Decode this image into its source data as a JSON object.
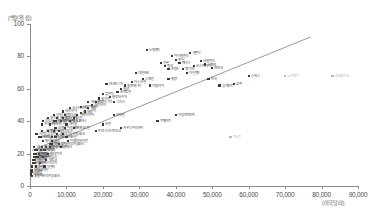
{
  "chart_data": {
    "type": "scatter",
    "title": "",
    "xlabel": "(미국달러)",
    "ylabel": "(백분위 점)",
    "xlim": [
      0,
      90000
    ],
    "ylim": [
      0,
      100
    ],
    "xticks": [
      "0",
      "10,000",
      "20,000",
      "30,000",
      "40,000",
      "50,000",
      "60,000",
      "70,000",
      "80,000",
      "90,000"
    ],
    "xtick_values": [
      0,
      10000,
      20000,
      30000,
      40000,
      50000,
      60000,
      70000,
      80000,
      90000
    ],
    "yticks": [
      "0",
      "20",
      "40",
      "60",
      "80",
      "100"
    ],
    "ytick_values": [
      0,
      20,
      40,
      60,
      80,
      100
    ],
    "grid": false,
    "legend": "none",
    "trendline": {
      "x0": 500,
      "y0": 22,
      "x1": 77000,
      "y1": 92,
      "color": "#6d6d6d"
    },
    "points": [
      {
        "label": "룩셈부르크",
        "x": 83000,
        "y": 68,
        "grey": true
      },
      {
        "label": "노르웨이",
        "x": 70000,
        "y": 68,
        "grey": true
      },
      {
        "label": "스위스",
        "x": 60000,
        "y": 68
      },
      {
        "label": "카타르",
        "x": 55000,
        "y": 30,
        "grey": true
      },
      {
        "label": "호주",
        "x": 56000,
        "y": 63
      },
      {
        "label": "덴마크",
        "x": 50000,
        "y": 73
      },
      {
        "label": "스웨덴",
        "x": 48000,
        "y": 75
      },
      {
        "label": "네덜란드",
        "x": 47000,
        "y": 77
      },
      {
        "label": "미국",
        "x": 49000,
        "y": 66
      },
      {
        "label": "오스트리아",
        "x": 45000,
        "y": 74
      },
      {
        "label": "핀란드",
        "x": 44000,
        "y": 82
      },
      {
        "label": "아일랜드",
        "x": 43000,
        "y": 70
      },
      {
        "label": "벨기에",
        "x": 42000,
        "y": 72
      },
      {
        "label": "캐나다",
        "x": 41000,
        "y": 76
      },
      {
        "label": "독일",
        "x": 40000,
        "y": 78
      },
      {
        "label": "아이슬란드",
        "x": 39000,
        "y": 80
      },
      {
        "label": "프랑스",
        "x": 38000,
        "y": 72
      },
      {
        "label": "영국",
        "x": 37000,
        "y": 74
      },
      {
        "label": "일본",
        "x": 36000,
        "y": 76
      },
      {
        "label": "뉴질랜드",
        "x": 32000,
        "y": 84
      },
      {
        "label": "이탈리아",
        "x": 33000,
        "y": 62
      },
      {
        "label": "스페인",
        "x": 31000,
        "y": 66
      },
      {
        "label": "대한민국",
        "x": 29000,
        "y": 70
      },
      {
        "label": "이스라엘",
        "x": 28000,
        "y": 64
      },
      {
        "label": "슬로베니아",
        "x": 26000,
        "y": 62
      },
      {
        "label": "체코",
        "x": 25000,
        "y": 60
      },
      {
        "label": "포르투갈",
        "x": 24000,
        "y": 58
      },
      {
        "label": "그리스",
        "x": 23000,
        "y": 52
      },
      {
        "label": "슬로바키아",
        "x": 22000,
        "y": 55
      },
      {
        "label": "에스토니아",
        "x": 21000,
        "y": 63
      },
      {
        "label": "폴란드",
        "x": 20000,
        "y": 57
      },
      {
        "label": "헝가리",
        "x": 19000,
        "y": 54
      },
      {
        "label": "리투아니아",
        "x": 18000,
        "y": 52
      },
      {
        "label": "라트비아",
        "x": 17000,
        "y": 50
      },
      {
        "label": "칠레",
        "x": 16000,
        "y": 48
      },
      {
        "label": "러시아",
        "x": 15000,
        "y": 46
      },
      {
        "label": "크로아티아",
        "x": 14000,
        "y": 49
      },
      {
        "label": "말레이시아",
        "x": 13000,
        "y": 44
      },
      {
        "label": "터키",
        "x": 12000,
        "y": 42
      },
      {
        "label": "멕시코",
        "x": 11000,
        "y": 40
      },
      {
        "label": "브라질",
        "x": 10000,
        "y": 38
      },
      {
        "label": "아르헨티나",
        "x": 9500,
        "y": 36
      },
      {
        "label": "불가리아",
        "x": 9000,
        "y": 42
      },
      {
        "label": "루마니아",
        "x": 8500,
        "y": 40
      },
      {
        "label": "남아프리카공화국",
        "x": 8000,
        "y": 26
      },
      {
        "label": "중국",
        "x": 7500,
        "y": 32
      },
      {
        "label": "콜롬비아",
        "x": 7000,
        "y": 30
      },
      {
        "label": "태국",
        "x": 6500,
        "y": 34
      },
      {
        "label": "페루",
        "x": 6000,
        "y": 28
      },
      {
        "label": "이란",
        "x": 5500,
        "y": 26
      },
      {
        "label": "인도네시아",
        "x": 4500,
        "y": 24
      },
      {
        "label": "이집트",
        "x": 4000,
        "y": 22
      },
      {
        "label": "필리핀",
        "x": 3500,
        "y": 28
      },
      {
        "label": "베트남",
        "x": 3000,
        "y": 30
      },
      {
        "label": "우크라이나",
        "x": 3200,
        "y": 38
      },
      {
        "label": "스리랑카",
        "x": 3400,
        "y": 34
      },
      {
        "label": "인도",
        "x": 2500,
        "y": 20
      },
      {
        "label": "파키스탄",
        "x": 2000,
        "y": 18
      },
      {
        "label": "방글라데시",
        "x": 1500,
        "y": 20
      },
      {
        "label": "케냐",
        "x": 1300,
        "y": 22
      },
      {
        "label": "가나",
        "x": 1200,
        "y": 24
      },
      {
        "label": "네팔",
        "x": 1000,
        "y": 18
      },
      {
        "label": "탄자니아",
        "x": 900,
        "y": 16
      },
      {
        "label": "우간다",
        "x": 800,
        "y": 14
      },
      {
        "label": "모잠비크",
        "x": 600,
        "y": 12
      },
      {
        "label": "에티오피아",
        "x": 500,
        "y": 10
      },
      {
        "label": "말라위",
        "x": 400,
        "y": 9
      },
      {
        "label": "부룬디",
        "x": 300,
        "y": 8
      },
      {
        "label": "니제르",
        "x": 350,
        "y": 7
      },
      {
        "label": "중앙아프리카공화국",
        "x": 450,
        "y": 6
      },
      {
        "label": "싱가포르",
        "x": 52000,
        "y": 62
      },
      {
        "label": "홍콩",
        "x": 38000,
        "y": 66
      },
      {
        "label": "아랍에미리트",
        "x": 40000,
        "y": 44
      },
      {
        "label": "사우디아라비아",
        "x": 25000,
        "y": 36
      },
      {
        "label": "쿠웨이트",
        "x": 35000,
        "y": 40
      },
      {
        "label": "오만",
        "x": 20000,
        "y": 38
      },
      {
        "label": "바레인",
        "x": 23000,
        "y": 44
      },
      {
        "label": "코스타리카",
        "x": 11000,
        "y": 48
      },
      {
        "label": "우루과이",
        "x": 16000,
        "y": 52
      },
      {
        "label": "파나마",
        "x": 14000,
        "y": 45
      },
      {
        "label": "도미니카공화국",
        "x": 9000,
        "y": 32
      },
      {
        "label": "에콰도르",
        "x": 8000,
        "y": 34
      },
      {
        "label": "과테말라",
        "x": 5000,
        "y": 20
      },
      {
        "label": "온두라스",
        "x": 3500,
        "y": 18
      },
      {
        "label": "니카라과",
        "x": 3000,
        "y": 22
      },
      {
        "label": "볼리비아",
        "x": 3200,
        "y": 24
      },
      {
        "label": "파라과이",
        "x": 6000,
        "y": 26
      },
      {
        "label": "엘살바도르",
        "x": 5500,
        "y": 24
      },
      {
        "label": "자메이카",
        "x": 6500,
        "y": 40
      },
      {
        "label": "트리니다드토바고",
        "x": 18000,
        "y": 34
      },
      {
        "label": "모로코",
        "x": 4500,
        "y": 16
      },
      {
        "label": "튀니지",
        "x": 6000,
        "y": 30
      },
      {
        "label": "알제리",
        "x": 8500,
        "y": 24
      },
      {
        "label": "요르단",
        "x": 7000,
        "y": 36
      },
      {
        "label": "레바논",
        "x": 10000,
        "y": 30
      },
      {
        "label": "카자흐스탄",
        "x": 12000,
        "y": 36
      },
      {
        "label": "아제르바이잔",
        "x": 10500,
        "y": 28
      },
      {
        "label": "벨라루스",
        "x": 9500,
        "y": 44
      },
      {
        "label": "세르비아",
        "x": 9000,
        "y": 46
      },
      {
        "label": "북마케도니아",
        "x": 7500,
        "y": 42
      },
      {
        "label": "알바니아",
        "x": 6500,
        "y": 44
      },
      {
        "label": "보스니아헤르체고비나",
        "x": 7000,
        "y": 40
      },
      {
        "label": "몰도바",
        "x": 3500,
        "y": 40
      },
      {
        "label": "조지아",
        "x": 5000,
        "y": 42
      },
      {
        "label": "아르메니아",
        "x": 5500,
        "y": 38
      },
      {
        "label": "몽골",
        "x": 5000,
        "y": 34
      },
      {
        "label": "우즈베키스탄",
        "x": 2500,
        "y": 30
      },
      {
        "label": "키르기스스탄",
        "x": 1800,
        "y": 32
      },
      {
        "label": "캄보디아",
        "x": 1800,
        "y": 22
      },
      {
        "label": "미얀마",
        "x": 1600,
        "y": 20
      },
      {
        "label": "라오스",
        "x": 2200,
        "y": 18
      },
      {
        "label": "세네갈",
        "x": 1400,
        "y": 16
      },
      {
        "label": "카메룬",
        "x": 1600,
        "y": 18
      },
      {
        "label": "잠비아",
        "x": 1300,
        "y": 14
      },
      {
        "label": "짐바브웨",
        "x": 1100,
        "y": 20
      },
      {
        "label": "나이지리아",
        "x": 2800,
        "y": 14
      },
      {
        "label": "앙골라",
        "x": 4000,
        "y": 12
      },
      {
        "label": "수단",
        "x": 1700,
        "y": 12
      }
    ]
  }
}
